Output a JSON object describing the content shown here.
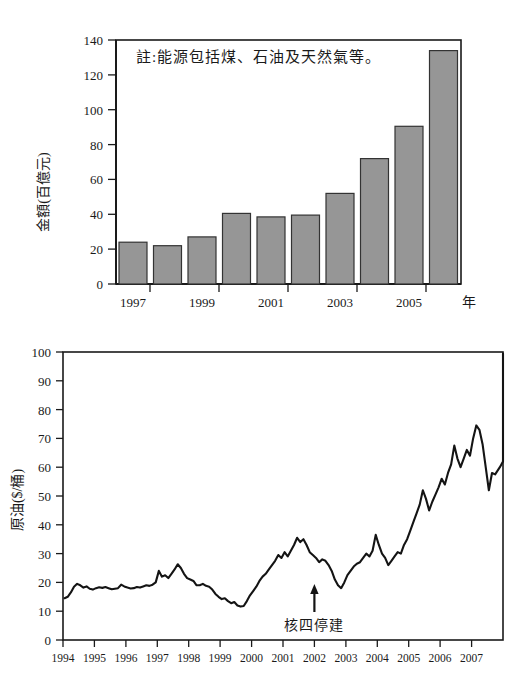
{
  "document": {
    "title": "能源進口金額與原油價格圖",
    "background_color": "#ffffff"
  },
  "chart_data": [
    {
      "id": "energy-import-bar-chart",
      "type": "bar",
      "title": "",
      "xlabel": "年",
      "ylabel": "金額(百億元)",
      "annotation": "註:能源包括煤、石油及天然氣等。",
      "categories": [
        "1997",
        "1998",
        "1999",
        "2000",
        "2001",
        "2002",
        "2003",
        "2004",
        "2005",
        "2006"
      ],
      "tick_labels": [
        "1997",
        "1999",
        "2001",
        "2003",
        "2005"
      ],
      "values": [
        24,
        22,
        27,
        40.5,
        38.5,
        39.5,
        52,
        72,
        90.5,
        134
      ],
      "ylim": [
        0,
        140
      ],
      "yticks": [
        0,
        20,
        40,
        60,
        80,
        100,
        120,
        140
      ],
      "grid": false,
      "bar_fill": "#969696",
      "bar_stroke": "#333333",
      "legend": "none"
    },
    {
      "id": "crude-oil-price-line-chart",
      "type": "line",
      "title": "",
      "xlabel": "",
      "ylabel": "原油($/桶)",
      "annotation": "核四停建",
      "annotation_x": "2002",
      "annotation_y": 18,
      "xlim": [
        1994,
        2008
      ],
      "ylim": [
        0,
        100
      ],
      "yticks": [
        0,
        10,
        20,
        30,
        40,
        50,
        60,
        70,
        80,
        90,
        100
      ],
      "xticks": [
        "1994",
        "1995",
        "1996",
        "1997",
        "1998",
        "1999",
        "2000",
        "2001",
        "2002",
        "2003",
        "2004",
        "2005",
        "2006",
        "2007"
      ],
      "grid": false,
      "line_color": "#141414",
      "legend": "none",
      "series": [
        {
          "name": "原油價格",
          "x": [
            1994.05,
            1994.15,
            1994.25,
            1994.35,
            1994.45,
            1994.55,
            1994.65,
            1994.75,
            1994.85,
            1994.95,
            1995.05,
            1995.15,
            1995.25,
            1995.35,
            1995.45,
            1995.55,
            1995.65,
            1995.75,
            1995.85,
            1995.95,
            1996.05,
            1996.15,
            1996.25,
            1996.35,
            1996.45,
            1996.55,
            1996.65,
            1996.75,
            1996.85,
            1996.95,
            1997.05,
            1997.15,
            1997.25,
            1997.35,
            1997.45,
            1997.55,
            1997.65,
            1997.75,
            1997.85,
            1997.95,
            1998.05,
            1998.15,
            1998.25,
            1998.35,
            1998.45,
            1998.55,
            1998.65,
            1998.75,
            1998.85,
            1998.95,
            1999.05,
            1999.15,
            1999.25,
            1999.35,
            1999.45,
            1999.55,
            1999.65,
            1999.75,
            1999.85,
            1999.95,
            2000.05,
            2000.15,
            2000.25,
            2000.35,
            2000.45,
            2000.55,
            2000.65,
            2000.75,
            2000.85,
            2000.95,
            2001.05,
            2001.15,
            2001.25,
            2001.35,
            2001.45,
            2001.55,
            2001.65,
            2001.75,
            2001.85,
            2001.95,
            2002.05,
            2002.15,
            2002.25,
            2002.35,
            2002.45,
            2002.55,
            2002.65,
            2002.75,
            2002.85,
            2002.95,
            2003.05,
            2003.15,
            2003.25,
            2003.35,
            2003.45,
            2003.55,
            2003.65,
            2003.75,
            2003.85,
            2003.95,
            2004.05,
            2004.15,
            2004.25,
            2004.35,
            2004.45,
            2004.55,
            2004.65,
            2004.75,
            2004.85,
            2004.95,
            2005.05,
            2005.15,
            2005.25,
            2005.35,
            2005.45,
            2005.55,
            2005.65,
            2005.75,
            2005.85,
            2005.95,
            2006.05,
            2006.15,
            2006.25,
            2006.35,
            2006.45,
            2006.55,
            2006.65,
            2006.75,
            2006.85,
            2006.95,
            2007.05,
            2007.15,
            2007.25,
            2007.35,
            2007.45,
            2007.55,
            2007.65,
            2007.75,
            2007.9
          ],
          "y": [
            14.5,
            15.0,
            16.5,
            18.5,
            19.5,
            19.0,
            18.2,
            18.6,
            17.8,
            17.5,
            18.0,
            18.3,
            18.1,
            18.4,
            18.0,
            17.6,
            17.8,
            18.0,
            19.2,
            18.6,
            18.2,
            17.9,
            18.0,
            18.4,
            18.2,
            18.6,
            19.0,
            18.8,
            19.2,
            20.0,
            24.0,
            22.0,
            22.5,
            21.5,
            23.0,
            24.5,
            26.3,
            25.0,
            23.0,
            21.5,
            21.0,
            20.5,
            19.0,
            19.0,
            19.5,
            18.8,
            18.5,
            17.5,
            16.0,
            15.0,
            14.2,
            14.5,
            13.5,
            12.8,
            13.2,
            12.0,
            11.6,
            11.8,
            13.5,
            15.5,
            17.0,
            18.5,
            20.5,
            22.0,
            23.0,
            24.5,
            26.0,
            27.5,
            29.5,
            28.5,
            30.5,
            29.0,
            31.0,
            33.0,
            35.5,
            34.0,
            35.0,
            33.0,
            30.5,
            29.5,
            28.5,
            27.0,
            28.0,
            27.5,
            26.0,
            24.0,
            21.0,
            19.0,
            18.0,
            20.0,
            22.5,
            24.0,
            25.5,
            26.5,
            27.0,
            28.5,
            30.0,
            29.0,
            31.0,
            36.5,
            33.0,
            30.0,
            28.5,
            26.0,
            27.5,
            29.0,
            30.5,
            30.0,
            33.0,
            35.0,
            38.0,
            41.0,
            44.0,
            47.0,
            52.0,
            49.0,
            45.0,
            48.0,
            50.5,
            53.0,
            56.0,
            54.0,
            58.0,
            61.0,
            67.5,
            63.0,
            60.0,
            63.0,
            66.0,
            64.0,
            70.0,
            74.5,
            73.0,
            68.0,
            60.0,
            52.0,
            58.0,
            57.5,
            60.0
          ],
          "y_tail": [
            62.0,
            65.0,
            70.0,
            74.0,
            78.0,
            84.0,
            90.0,
            95.0,
            99.5
          ]
        }
      ]
    }
  ]
}
